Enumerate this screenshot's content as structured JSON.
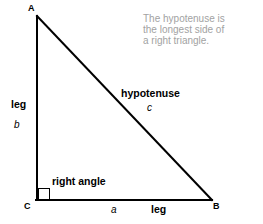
{
  "figure": {
    "background_color": "#ffffff",
    "stroke_color": "#000000",
    "caption_color": "#a2a2a2"
  },
  "caption": {
    "lines": [
      "The hypotenuse is",
      "the longest side of",
      "a right triangle."
    ]
  },
  "vertices": {
    "a": "A",
    "b": "B",
    "c": "C"
  },
  "labels": {
    "leg_left_name": "leg",
    "leg_left_var": "b",
    "leg_bottom_var": "a",
    "leg_bottom_name": "leg",
    "hypotenuse_name": "hypotenuse",
    "hypotenuse_var": "c",
    "right_angle": "right angle"
  },
  "geometry": {
    "apex_a": [
      37,
      16
    ],
    "vertex_c": [
      37,
      200
    ],
    "vertex_b": [
      211,
      200
    ],
    "right_angle_marker": [
      38,
      189,
      11,
      11
    ],
    "stroke_width": 2
  }
}
